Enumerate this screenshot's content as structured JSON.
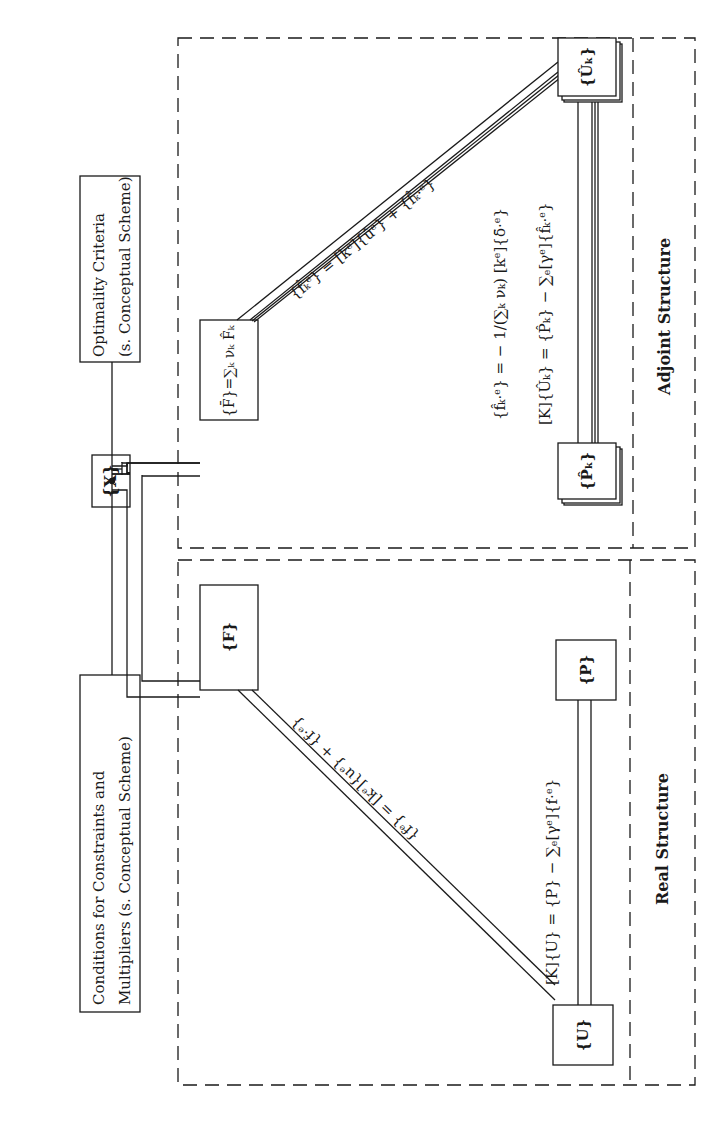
{
  "diagram": {
    "top": {
      "design_variables": "{X}",
      "optimality_box": {
        "line1": "Optimality Criteria",
        "line2": "(s. Conceptual Scheme)"
      },
      "conditions_box": {
        "line1": "Conditions for Constraints and",
        "line2": "Multipliers (s. Conceptual Scheme)"
      }
    },
    "adjoint": {
      "label": "Adjoint Structure",
      "fbar_node": "{F̄}=∑ₖ νₖ F̂ₖ",
      "uk_node": "{Ûₖ}",
      "pk_node": "{P̂ₖ}",
      "diag_equation": "{f̂ₖᵉ} = [kᵉ]{ûᵉ} + {f̂ₖ·ᵉ}",
      "equation1": "{f̂ₖ·ᵉ} = − 1/(∑ₖ νₖ) [kᵉ]{δ̄·ᵉ}",
      "equation2": "[K]{Ûₖ} = {P̂ₖ} − ∑ₑ[γᵉ]{f̂ₖ·ᵉ}"
    },
    "real": {
      "label": "Real Structure",
      "f_node": "{F}",
      "u_node": "{U}",
      "p_node": "{P}",
      "diag_equation": "{fᵉ} = [kᵉ]{uᵉ} + {f·ᵉ}",
      "equation": "[K]{U} = {P} − ∑ₑ[γᵉ]{f·ᵉ}"
    }
  },
  "colors": {
    "ink": "#1a1a1a",
    "background": "#ffffff"
  }
}
